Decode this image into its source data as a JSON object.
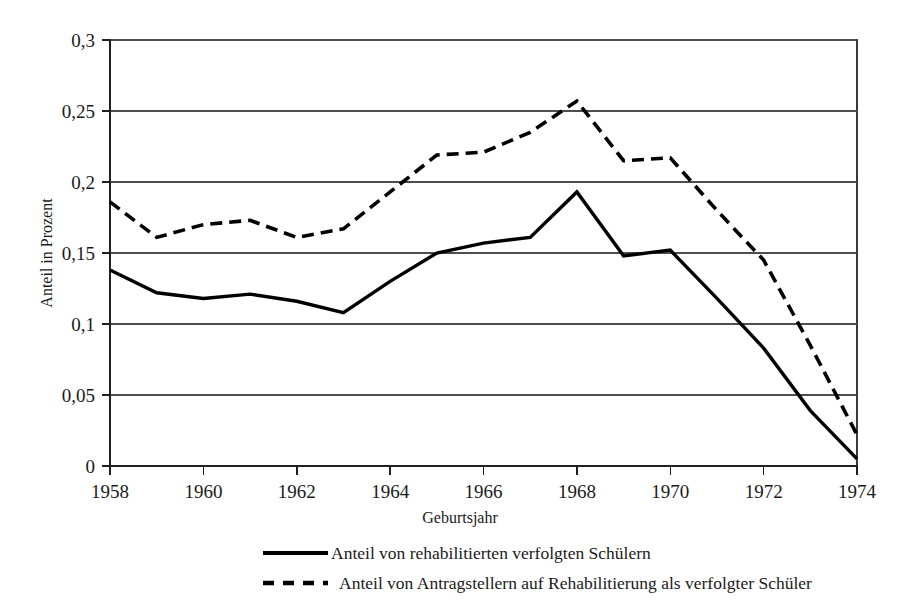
{
  "chart_data": {
    "type": "line",
    "title": "",
    "xlabel": "Geburtsjahr",
    "ylabel": "Anteil in Prozent",
    "x": [
      1958,
      1959,
      1960,
      1961,
      1962,
      1963,
      1964,
      1965,
      1966,
      1967,
      1968,
      1969,
      1970,
      1971,
      1972,
      1973,
      1974
    ],
    "xlim": [
      1958,
      1974
    ],
    "ylim": [
      0,
      0.3
    ],
    "xticks": [
      1958,
      1960,
      1962,
      1964,
      1966,
      1968,
      1970,
      1972,
      1974
    ],
    "xtick_labels": [
      "1958",
      "1960",
      "1962",
      "1964",
      "1966",
      "1968",
      "1970",
      "1972",
      "1974"
    ],
    "yticks": [
      0,
      0.05,
      0.1,
      0.15,
      0.2,
      0.25,
      0.3
    ],
    "ytick_labels": [
      "0",
      "0,05",
      "0,1",
      "0,15",
      "0,2",
      "0,25",
      "0,3"
    ],
    "grid": true,
    "grid_axis": "y",
    "legend_position": "bottom",
    "series": [
      {
        "name": "Anteil von rehabilitierten verfolgten Schülern",
        "style": "solid",
        "color": "#000000",
        "values": [
          0.138,
          0.122,
          0.118,
          0.121,
          0.116,
          0.108,
          0.13,
          0.15,
          0.157,
          0.161,
          0.193,
          0.148,
          0.152,
          0.118,
          0.083,
          0.039,
          0.005
        ]
      },
      {
        "name": "Anteil von Antragstellern auf Rehabilitierung als verfolgter Schüler",
        "style": "dashed",
        "color": "#000000",
        "values": [
          0.186,
          0.161,
          0.17,
          0.173,
          0.161,
          0.167,
          0.193,
          0.219,
          0.221,
          0.235,
          0.257,
          0.215,
          0.217,
          0.18,
          0.145,
          0.085,
          0.022
        ]
      }
    ]
  },
  "axes": {
    "y_axis_title": "Anteil in Prozent",
    "x_axis_title": "Geburtsjahr"
  },
  "legend": {
    "entries": [
      {
        "label": "Anteil von rehabilitierten verfolgten Schülern",
        "style": "solid"
      },
      {
        "label": "Anteil von Antragstellern auf Rehabilitierung als verfolgter Schüler",
        "style": "dashed"
      }
    ]
  },
  "colors": {
    "series": "#000000",
    "gridline": "#4d4d4d",
    "background": "#ffffff",
    "text": "#1a1a1a"
  }
}
